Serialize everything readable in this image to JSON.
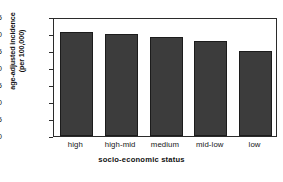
{
  "chart_data": {
    "type": "bar",
    "title": "",
    "subtitle": "",
    "categories": [
      "high",
      "high-mid",
      "medium",
      "mid-low",
      "low"
    ],
    "values": [
      30.6,
      30.0,
      29.0,
      28.0,
      25.0
    ],
    "series": [
      {
        "name": "age-adjusted incidence",
        "values": [
          30.6,
          30.0,
          29.0,
          28.0,
          25.0
        ]
      }
    ],
    "xlabel": "socio-economic status",
    "ylabel_line1": "age-adjusted incidence",
    "ylabel_line2": "(per 100,000)",
    "ylabel": "age-adjusted incidence (per 100,000)",
    "ylim": [
      0,
      35
    ],
    "yticks": [
      "0",
      "5",
      "10",
      "15",
      "20",
      "25",
      "30",
      "35"
    ],
    "ytick_values": [
      0,
      5,
      10,
      15,
      20,
      25,
      30,
      35
    ],
    "grid": false,
    "legend": "none",
    "bar_color": "#3c3c3c",
    "bar_edge_color": "#1c1c1c",
    "frame_color": "#2b2b2b",
    "background": "#ffffff"
  }
}
